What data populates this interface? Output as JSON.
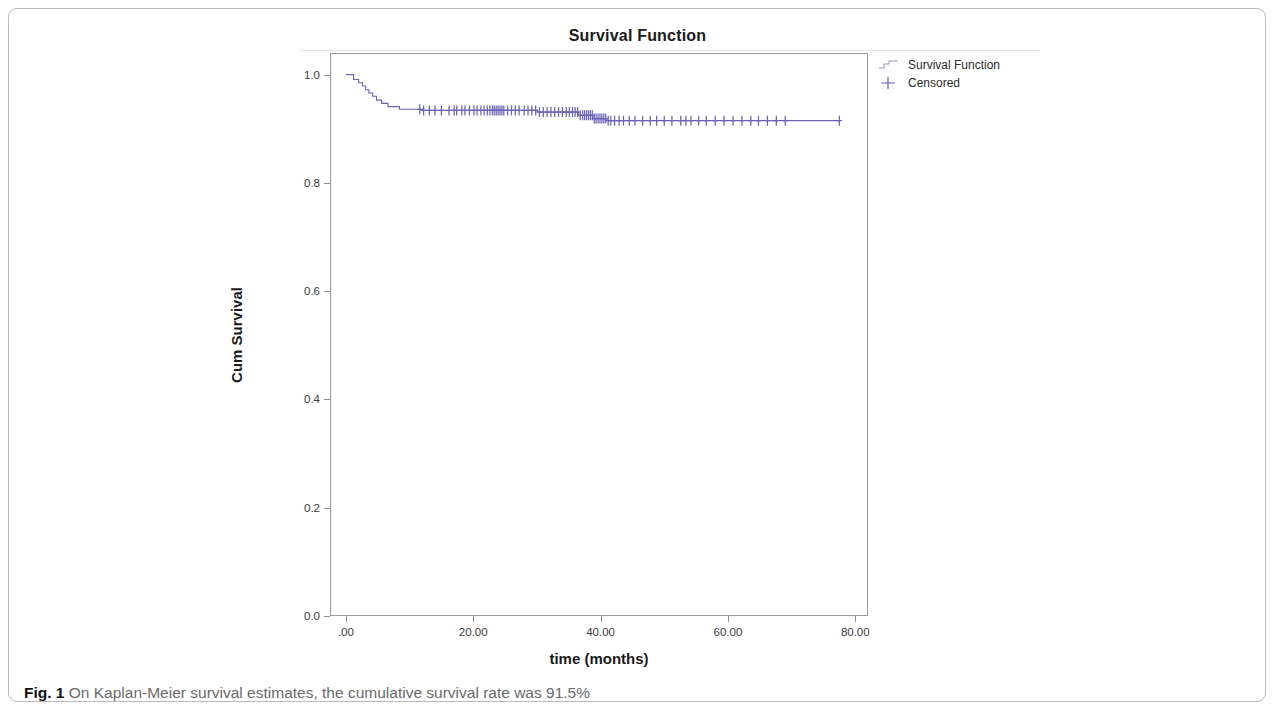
{
  "figure": {
    "caption_label": "Fig. 1",
    "caption_text": "On Kaplan-Meier survival estimates, the cumulative survival rate was 91.5%"
  },
  "chart_data": {
    "type": "line",
    "title": "Survival Function",
    "xlabel": "time (months)",
    "ylabel": "Cum Survival",
    "xlim": [
      -2.5,
      82
    ],
    "ylim": [
      0.0,
      1.04
    ],
    "xticks": [
      0,
      20,
      40,
      60,
      80
    ],
    "xtick_labels": [
      ".00",
      "20.00",
      "40.00",
      "60.00",
      "80.00"
    ],
    "yticks": [
      0.0,
      0.2,
      0.4,
      0.6,
      0.8,
      1.0
    ],
    "ytick_labels": [
      "0.0",
      "0.2",
      "0.4",
      "0.6",
      "0.8",
      "1.0"
    ],
    "grid": false,
    "legend_position": "right-top",
    "line_color": "#6b63b5",
    "legend": [
      {
        "label": "Survival Function",
        "marker": "step-line"
      },
      {
        "label": "Censored",
        "marker": "plus"
      }
    ],
    "series": [
      {
        "name": "Survival Function",
        "type": "step",
        "points": [
          [
            0.0,
            1.0
          ],
          [
            1.2,
            1.0
          ],
          [
            1.2,
            0.991
          ],
          [
            2.0,
            0.991
          ],
          [
            2.0,
            0.985
          ],
          [
            2.6,
            0.985
          ],
          [
            2.6,
            0.979
          ],
          [
            3.1,
            0.979
          ],
          [
            3.1,
            0.972
          ],
          [
            3.6,
            0.972
          ],
          [
            3.6,
            0.966
          ],
          [
            4.2,
            0.966
          ],
          [
            4.2,
            0.96
          ],
          [
            4.8,
            0.96
          ],
          [
            4.8,
            0.953
          ],
          [
            5.6,
            0.953
          ],
          [
            5.6,
            0.947
          ],
          [
            6.6,
            0.947
          ],
          [
            6.6,
            0.941
          ],
          [
            8.4,
            0.941
          ],
          [
            8.4,
            0.936
          ],
          [
            12.0,
            0.936
          ],
          [
            12.0,
            0.934
          ],
          [
            30.0,
            0.934
          ],
          [
            30.0,
            0.931
          ],
          [
            36.5,
            0.931
          ],
          [
            36.5,
            0.925
          ],
          [
            38.8,
            0.925
          ],
          [
            38.8,
            0.919
          ],
          [
            41.0,
            0.919
          ],
          [
            41.0,
            0.915
          ],
          [
            77.5,
            0.915
          ]
        ]
      },
      {
        "name": "Censored",
        "type": "marker",
        "marker": "plus",
        "x": [
          11.6,
          12.2,
          13.1,
          14.0,
          15.0,
          16.2,
          17.0,
          17.4,
          18.2,
          18.7,
          19.4,
          20.1,
          20.6,
          21.2,
          21.7,
          22.2,
          22.6,
          23.0,
          23.3,
          23.6,
          23.9,
          24.2,
          24.5,
          24.8,
          25.4,
          26.0,
          26.6,
          27.2,
          28.0,
          28.6,
          29.2,
          29.8,
          30.4,
          31.0,
          31.6,
          32.2,
          32.8,
          33.4,
          34.0,
          34.6,
          35.1,
          35.6,
          36.0,
          36.4,
          36.8,
          37.2,
          37.5,
          37.8,
          38.1,
          38.4,
          38.7,
          39.0,
          39.3,
          39.6,
          39.9,
          40.2,
          40.5,
          40.8,
          41.2,
          41.6,
          42.2,
          42.9,
          43.6,
          44.5,
          45.4,
          46.6,
          47.8,
          48.8,
          50.0,
          51.2,
          52.6,
          53.4,
          54.2,
          55.4,
          56.6,
          58.0,
          59.4,
          60.8,
          62.2,
          63.6,
          64.8,
          66.2,
          67.6,
          69.0,
          77.5
        ],
        "y_level_early": 0.934,
        "y_level_late": 0.915
      }
    ]
  }
}
